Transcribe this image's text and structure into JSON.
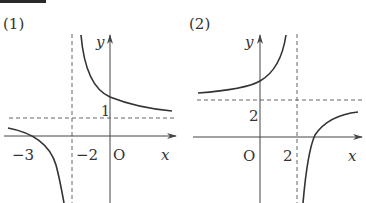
{
  "header_bar": {
    "color": "#2a2a2a"
  },
  "colors": {
    "curve": "#333333",
    "axis": "#444444",
    "asymptote": "#666666",
    "text": "#333333",
    "background": "#ffffff"
  },
  "graphs": [
    {
      "label": "(1)",
      "axis_labels": {
        "x": "x",
        "y": "y",
        "origin": "O"
      },
      "tick_labels": {
        "x_minus3": "−3",
        "x_minus2": "−2",
        "y_1": "1"
      },
      "asymptotes": {
        "vertical": "x = -2",
        "horizontal": "y = 1"
      }
    },
    {
      "label": "(2)",
      "axis_labels": {
        "x": "x",
        "y": "y",
        "origin": "O"
      },
      "tick_labels": {
        "x_2": "2",
        "y_2": "2"
      },
      "asymptotes": {
        "vertical": "x = 2",
        "horizontal": "y = 2"
      }
    }
  ]
}
